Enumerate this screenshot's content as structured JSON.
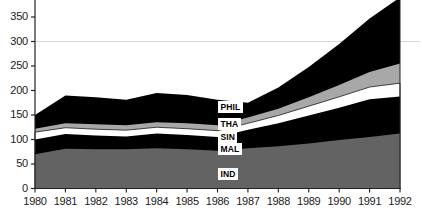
{
  "chart_data": {
    "type": "area",
    "title": "",
    "subtitle": "",
    "xlabel": "",
    "ylabel": "",
    "stacked": true,
    "grid": true,
    "gridlines_y": [
      300
    ],
    "legend_position": "inline-on-bands",
    "x": [
      1980,
      1981,
      1982,
      1983,
      1984,
      1985,
      1986,
      1987,
      1988,
      1989,
      1990,
      1991,
      1992
    ],
    "categories": [
      "1980",
      "1981",
      "1982",
      "1983",
      "1984",
      "1985",
      "1986",
      "1987",
      "1988",
      "1989",
      "1990",
      "1991",
      "1992"
    ],
    "xlim": [
      1980,
      1992
    ],
    "ylim": [
      0,
      365
    ],
    "yticks": [
      0,
      50,
      100,
      150,
      200,
      250,
      300,
      350
    ],
    "ytick_labels": [
      "0",
      "50",
      "100",
      "150",
      "200",
      "250",
      "300",
      "350"
    ],
    "xtick_labels": [
      "1980",
      "1981",
      "1982",
      "1983",
      "1984",
      "1985",
      "1986",
      "1987",
      "1988",
      "1989",
      "1990",
      "1991",
      "1992"
    ],
    "series": [
      {
        "name": "IND",
        "label": "IND",
        "color": "#636363",
        "values": [
          70,
          81,
          80,
          80,
          82,
          80,
          77,
          82,
          86,
          92,
          99,
          105,
          112
        ]
      },
      {
        "name": "MAL",
        "label": "MAL",
        "color": "#000000",
        "values": [
          30,
          30,
          28,
          26,
          30,
          29,
          28,
          38,
          47,
          57,
          66,
          77,
          76
        ]
      },
      {
        "name": "SIN",
        "label": "SIN",
        "color": "#ffffff",
        "values": [
          15,
          13,
          13,
          13,
          13,
          13,
          13,
          13,
          16,
          19,
          22,
          25,
          27
        ]
      },
      {
        "name": "THA",
        "label": "THA",
        "color": "#a8a8a8",
        "values": [
          7,
          9,
          10,
          10,
          10,
          11,
          11,
          12,
          14,
          18,
          24,
          31,
          40
        ]
      },
      {
        "name": "PHIL",
        "label": "PHIL",
        "color": "#000000",
        "values": [
          28,
          57,
          55,
          52,
          60,
          58,
          52,
          30,
          43,
          62,
          84,
          109,
          135
        ]
      }
    ],
    "stack_tops": {
      "IND": [
        70,
        81,
        80,
        80,
        82,
        80,
        77,
        82,
        86,
        92,
        99,
        105,
        112
      ],
      "MAL": [
        100,
        111,
        108,
        106,
        112,
        109,
        105,
        120,
        133,
        149,
        165,
        182,
        188
      ],
      "SIN": [
        115,
        124,
        121,
        119,
        125,
        122,
        118,
        133,
        149,
        168,
        187,
        207,
        215
      ],
      "THA": [
        122,
        133,
        131,
        129,
        135,
        133,
        129,
        145,
        163,
        186,
        211,
        238,
        255
      ],
      "PHIL": [
        150,
        190,
        186,
        181,
        195,
        191,
        181,
        175,
        206,
        248,
        295,
        347,
        390
      ]
    },
    "band_labels": [
      {
        "name": "PHIL",
        "x_px": 218,
        "y_px": 101
      },
      {
        "name": "THA",
        "x_px": 218,
        "y_px": 118
      },
      {
        "name": "SIN",
        "x_px": 218,
        "y_px": 131
      },
      {
        "name": "MAL",
        "x_px": 218,
        "y_px": 143
      },
      {
        "name": "IND",
        "x_px": 218,
        "y_px": 168
      }
    ]
  },
  "axes": {
    "axis_color": "#222222",
    "grid_color": "#cccccc",
    "tick_color": "#222222"
  }
}
